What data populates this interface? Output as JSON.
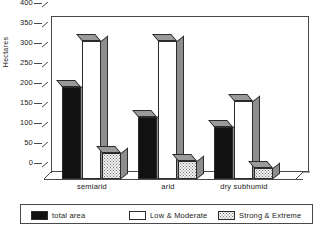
{
  "chart_data": {
    "type": "bar",
    "title": "",
    "subtitle": "",
    "xlabel": "",
    "ylabel": "Hectares",
    "ylim": [
      0,
      400
    ],
    "ytick_values": [
      400,
      350,
      300,
      250,
      200,
      150,
      100,
      50,
      0
    ],
    "ytick_labels": [
      "400",
      "350",
      "300",
      "250",
      "200",
      "150",
      "100",
      "50",
      "0"
    ],
    "grid": false,
    "legend_position": "bottom",
    "style": "3d-bar",
    "categories": [
      "semiarid",
      "arid",
      "dry subhumid"
    ],
    "series": [
      {
        "name": "total area",
        "values": [
          230,
          155,
          130
        ],
        "color": "#111111",
        "fill": "solid"
      },
      {
        "name": "Low & Moderate",
        "values": [
          345,
          345,
          195
        ],
        "color": "#ffffff",
        "fill": "empty"
      },
      {
        "name": "Strong & Extreme",
        "values": [
          65,
          45,
          28
        ],
        "color": "#f2f2f2",
        "fill": "dotted"
      }
    ]
  },
  "legend": {
    "items": [
      {
        "label": "total area"
      },
      {
        "label": "Low & Moderate"
      },
      {
        "label": "Strong & Extreme"
      }
    ]
  },
  "colors": {
    "axis": "#4a4a4a",
    "text": "#1a1a1a",
    "bar_side": "#8d8d8d",
    "bar_top": "#9a9a9a"
  }
}
